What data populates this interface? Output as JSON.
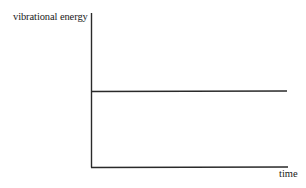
{
  "chart_data": {
    "type": "line",
    "title": "",
    "xlabel": "time",
    "ylabel": "vibrational energy",
    "x": [
      0,
      1
    ],
    "series": [
      {
        "name": "vibrational energy",
        "values": [
          0.5,
          0.5
        ]
      }
    ],
    "ylim": [
      0,
      1
    ],
    "xlim": [
      0,
      1
    ],
    "grid": false,
    "legend": "none",
    "ticks": "none",
    "annotations": []
  },
  "colors": {
    "axis": "#2a2a2a",
    "line": "#2a2a2a",
    "background": "#ffffff"
  }
}
